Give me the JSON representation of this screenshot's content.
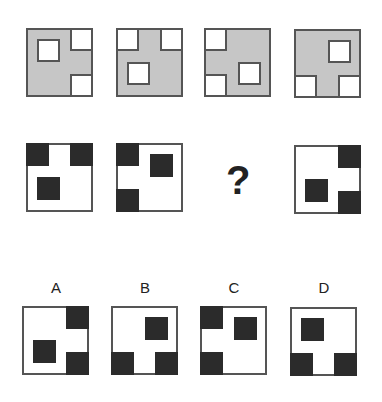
{
  "colors": {
    "gray": "#c6c6c6",
    "dark": "#2b2b2b",
    "border": "#555555"
  },
  "question_mark": "?",
  "row1": [
    {
      "x": 26,
      "y": 28,
      "cells": [
        {
          "x": 9,
          "y": 9,
          "type": "hole"
        },
        {
          "x": 42,
          "y": -2,
          "type": "hole"
        },
        {
          "x": 42,
          "y": 44,
          "type": "hole"
        }
      ]
    },
    {
      "x": 116,
      "y": 28,
      "cells": [
        {
          "x": -2,
          "y": -2,
          "type": "hole"
        },
        {
          "x": 42,
          "y": -2,
          "type": "hole"
        },
        {
          "x": 9,
          "y": 32,
          "type": "hole"
        }
      ]
    },
    {
      "x": 204,
      "y": 28,
      "cells": [
        {
          "x": -2,
          "y": -2,
          "type": "hole"
        },
        {
          "x": -2,
          "y": 44,
          "type": "hole"
        },
        {
          "x": 32,
          "y": 32,
          "type": "hole"
        }
      ]
    },
    {
      "x": 294,
      "y": 29,
      "cells": [
        {
          "x": 32,
          "y": 9,
          "type": "hole"
        },
        {
          "x": -2,
          "y": 44,
          "type": "hole"
        },
        {
          "x": 42,
          "y": 44,
          "type": "hole"
        }
      ]
    }
  ],
  "row2": [
    {
      "x": 26,
      "y": 143,
      "cells": [
        {
          "x": -2,
          "y": -2,
          "type": "dark"
        },
        {
          "x": 42,
          "y": -2,
          "type": "dark"
        },
        {
          "x": 9,
          "y": 32,
          "type": "dark"
        }
      ]
    },
    {
      "x": 116,
      "y": 143,
      "cells": [
        {
          "x": -2,
          "y": -2,
          "type": "dark"
        },
        {
          "x": -2,
          "y": 44,
          "type": "dark"
        },
        {
          "x": 32,
          "y": 9,
          "type": "dark"
        }
      ]
    },
    {
      "x": 294,
      "y": 145,
      "cells": [
        {
          "x": 42,
          "y": -2,
          "type": "dark"
        },
        {
          "x": 42,
          "y": 44,
          "type": "dark"
        },
        {
          "x": 9,
          "y": 32,
          "type": "dark"
        }
      ]
    }
  ],
  "options": [
    {
      "label": "A",
      "x": 22,
      "y": 306,
      "cells": [
        {
          "x": 42,
          "y": -2,
          "type": "dark"
        },
        {
          "x": 42,
          "y": 44,
          "type": "dark"
        },
        {
          "x": 9,
          "y": 32,
          "type": "dark"
        }
      ]
    },
    {
      "label": "B",
      "x": 111,
      "y": 306,
      "cells": [
        {
          "x": 32,
          "y": 9,
          "type": "dark"
        },
        {
          "x": -2,
          "y": 44,
          "type": "dark"
        },
        {
          "x": 42,
          "y": 44,
          "type": "dark"
        }
      ]
    },
    {
      "label": "C",
      "x": 200,
      "y": 306,
      "cells": [
        {
          "x": -2,
          "y": -2,
          "type": "dark"
        },
        {
          "x": -2,
          "y": 44,
          "type": "dark"
        },
        {
          "x": 32,
          "y": 9,
          "type": "dark"
        }
      ]
    },
    {
      "label": "D",
      "x": 290,
      "y": 307,
      "cells": [
        {
          "x": 9,
          "y": 9,
          "type": "dark"
        },
        {
          "x": -2,
          "y": 44,
          "type": "dark"
        },
        {
          "x": 42,
          "y": 44,
          "type": "dark"
        }
      ]
    }
  ]
}
